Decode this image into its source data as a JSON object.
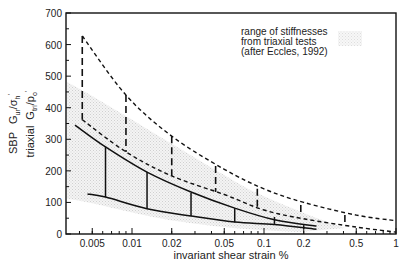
{
  "chart_data": {
    "type": "line",
    "title": "",
    "xlabel": "invariant shear strain %",
    "ylabel_lines": [
      "SBP  G_ur/σ_h'",
      "triaxial  G_tri/p_o'"
    ],
    "ylabel_parts": {
      "sbp_prefix": "SBP",
      "sbp_g": "G",
      "sbp_g_sub": "ur",
      "sbp_den": "/σ",
      "sbp_den_sub": "h",
      "sbp_prime": "'",
      "tri_prefix": "triaxial",
      "tri_g": "G",
      "tri_g_sub": "tri",
      "tri_den": "/p",
      "tri_den_sub": "o",
      "tri_prime": "'"
    },
    "xscale": "log",
    "xlim": [
      0.0034,
      1
    ],
    "ylim": [
      0,
      700
    ],
    "x_ticks": [
      {
        "value": 0.005,
        "label": "0.005"
      },
      {
        "value": 0.01,
        "label": "0.01"
      },
      {
        "value": 0.02,
        "label": "0.02"
      },
      {
        "value": 0.05,
        "label": "0.05"
      },
      {
        "value": 0.1,
        "label": "0.1"
      },
      {
        "value": 0.2,
        "label": "0.2"
      },
      {
        "value": 0.5,
        "label": "0.5"
      },
      {
        "value": 1,
        "label": "1"
      }
    ],
    "y_ticks": [
      {
        "value": 0,
        "label": "0"
      },
      {
        "value": 100,
        "label": "100"
      },
      {
        "value": 200,
        "label": "200"
      },
      {
        "value": 300,
        "label": "300"
      },
      {
        "value": 400,
        "label": "400"
      },
      {
        "value": 500,
        "label": "500"
      },
      {
        "value": 600,
        "label": "600"
      },
      {
        "value": 700,
        "label": "700"
      }
    ],
    "grid": false,
    "legend": {
      "position": "upper right",
      "lines": [
        "range of stiffnesses",
        "from triaxial tests",
        "(after Eccles, 1992)"
      ],
      "swatch": "stippled grey band"
    },
    "series": [
      {
        "name": "SBP upper bound (dashed)",
        "style": "dashed",
        "x": [
          0.0042,
          0.009,
          0.02,
          0.05,
          0.1,
          0.2,
          0.5,
          1
        ],
        "y": [
          627,
          440,
          310,
          205,
          143,
          100,
          60,
          42
        ]
      },
      {
        "name": "SBP lower bound (dashed)",
        "style": "dashed",
        "x": [
          0.0042,
          0.009,
          0.02,
          0.05,
          0.1,
          0.2,
          0.5,
          1
        ],
        "y": [
          362,
          260,
          184,
          125,
          76,
          48,
          22,
          6
        ]
      },
      {
        "name": "triaxial upper bound (solid)",
        "style": "solid",
        "x": [
          0.0037,
          0.0063,
          0.013,
          0.028,
          0.06,
          0.12,
          0.25
        ],
        "y": [
          345,
          276,
          196,
          133,
          82,
          45,
          25
        ]
      },
      {
        "name": "triaxial lower bound (solid)",
        "style": "solid",
        "x": [
          0.0046,
          0.0063,
          0.013,
          0.028,
          0.06,
          0.12,
          0.25
        ],
        "y": [
          127,
          117,
          80,
          57,
          38,
          30,
          15
        ]
      }
    ],
    "range_bars": {
      "sbp_dashed": [
        {
          "x": 0.0042,
          "y_top": 627,
          "y_bottom": 362
        },
        {
          "x": 0.009,
          "y_top": 440,
          "y_bottom": 260
        },
        {
          "x": 0.02,
          "y_top": 310,
          "y_bottom": 184
        },
        {
          "x": 0.043,
          "y_top": 215,
          "y_bottom": 133
        },
        {
          "x": 0.089,
          "y_top": 143,
          "y_bottom": 76
        },
        {
          "x": 0.19,
          "y_top": 92,
          "y_bottom": 63
        },
        {
          "x": 0.41,
          "y_top": 60,
          "y_bottom": 28
        }
      ],
      "triaxial_solid": [
        {
          "x": 0.0063,
          "y_top": 276,
          "y_bottom": 117
        },
        {
          "x": 0.013,
          "y_top": 196,
          "y_bottom": 80
        },
        {
          "x": 0.028,
          "y_top": 130,
          "y_bottom": 57
        },
        {
          "x": 0.06,
          "y_top": 82,
          "y_bottom": 37
        },
        {
          "x": 0.12,
          "y_top": 54,
          "y_bottom": 32
        },
        {
          "x": 0.2,
          "y_top": 28,
          "y_bottom": 16
        }
      ]
    }
  },
  "colors": {
    "line": "#111111",
    "shade": "#d9d9d9",
    "background": "#ffffff"
  }
}
